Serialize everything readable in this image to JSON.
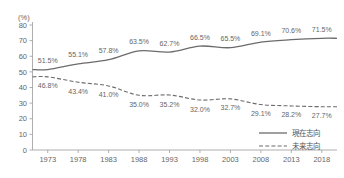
{
  "chart_data": {
    "type": "line",
    "title": "",
    "subtitle": "",
    "xlabel": "",
    "ylabel": "",
    "unit_label": "(%)",
    "ylim": [
      0,
      80
    ],
    "y_ticks": [
      0,
      10,
      20,
      30,
      40,
      50,
      60,
      70,
      80
    ],
    "y_tick_labels": [
      "0",
      "10",
      "20",
      "30",
      "40",
      "50",
      "60",
      "70",
      "80"
    ],
    "grid": false,
    "legend_position": "bottom-right",
    "categories": [
      1973,
      1978,
      1983,
      1988,
      1993,
      1998,
      2003,
      2008,
      2013,
      2018
    ],
    "category_labels": [
      "1973",
      "1978",
      "1983",
      "1988",
      "1993",
      "1998",
      "2003",
      "2008",
      "2013",
      "2018"
    ],
    "series": [
      {
        "name": "現在志向",
        "style": "solid",
        "color": "#6b6b6b",
        "label_position": "above",
        "values": [
          51.5,
          55.1,
          57.8,
          63.5,
          62.7,
          66.5,
          65.5,
          69.1,
          70.6,
          71.5
        ],
        "value_labels": [
          "51.5%",
          "55.1%",
          "57.8%",
          "63.5%",
          "62.7%",
          "66.5%",
          "65.5%",
          "69.1%",
          "70.6%",
          "71.5%"
        ]
      },
      {
        "name": "未来志向",
        "style": "dashed",
        "color": "#6b6b6b",
        "label_position": "below",
        "values": [
          46.8,
          43.4,
          41.0,
          35.0,
          35.2,
          32.0,
          32.7,
          29.1,
          28.2,
          27.7
        ],
        "value_labels": [
          "46.8%",
          "43.4%",
          "41.0%",
          "35.0%",
          "35.2%",
          "32.0%",
          "32.7%",
          "29.1%",
          "28.2%",
          "27.7%"
        ]
      }
    ],
    "legend": [
      {
        "label": "現在志向",
        "style": "solid"
      },
      {
        "label": "未来志向",
        "style": "dashed"
      }
    ]
  }
}
